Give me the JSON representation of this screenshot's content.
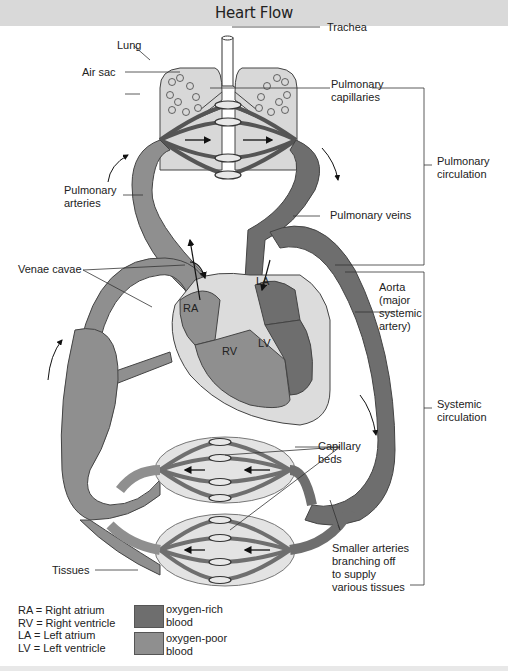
{
  "header": {
    "title": "Heart Flow"
  },
  "colors": {
    "oxygen_rich": "#6e6e6e",
    "oxygen_poor": "#8f8f8f",
    "tissue_fill": "#e3e3e3",
    "heart_wall": "#dcdcdc",
    "title_bar": "#d9d9d9"
  },
  "labels": {
    "lung": "Lung",
    "trachea": "Trachea",
    "air_sac": "Air sac",
    "pulmonary_capillaries_1": "Pulmonary",
    "pulmonary_capillaries_2": "capillaries",
    "pulmonary_circulation_1": "Pulmonary",
    "pulmonary_circulation_2": "circulation",
    "pulmonary_arteries_1": "Pulmonary",
    "pulmonary_arteries_2": "arteries",
    "pulmonary_veins": "Pulmonary veins",
    "venae_cavae": "Venae cavae",
    "ra": "RA",
    "rv": "RV",
    "la": "LA",
    "lv": "LV",
    "aorta_1": "Aorta",
    "aorta_2": "(major",
    "aorta_3": "systemic",
    "aorta_4": "artery)",
    "systemic_circulation_1": "Systemic",
    "systemic_circulation_2": "circulation",
    "capillary_beds_1": "Capillary",
    "capillary_beds_2": "beds",
    "smaller_arteries_1": "Smaller arteries",
    "smaller_arteries_2": "branching off",
    "smaller_arteries_3": "to supply",
    "smaller_arteries_4": "various tissues",
    "tissues": "Tissues"
  },
  "legend": {
    "abbreviations": [
      "RA = Right atrium",
      "RV = Right ventricle",
      "LA = Left atrium",
      "LV = Left ventricle"
    ],
    "swatches": [
      {
        "label_1": "oxygen-rich",
        "label_2": "blood",
        "color": "#6e6e6e"
      },
      {
        "label_1": "oxygen-poor",
        "label_2": "blood",
        "color": "#8f8f8f"
      }
    ]
  }
}
